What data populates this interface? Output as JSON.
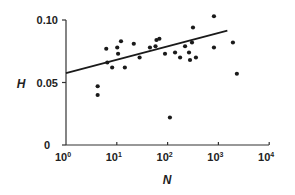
{
  "chart_data": {
    "type": "scatter",
    "title": "",
    "xlabel": "N",
    "ylabel": "H",
    "xscale": "log",
    "xlim": [
      1,
      10000
    ],
    "ylim": [
      0,
      0.1
    ],
    "x_ticks": [
      "10^0",
      "10^1",
      "10^2",
      "10^3",
      "10^4"
    ],
    "x_tick_values": [
      1,
      10,
      100,
      1000,
      10000
    ],
    "y_ticks": [
      "0",
      "0.05",
      "0.10"
    ],
    "y_tick_values": [
      0,
      0.05,
      0.1
    ],
    "grid": false,
    "legend": null,
    "series": [
      {
        "name": "data",
        "marker": "filled-circle",
        "color": "#1a1a1a",
        "points": [
          {
            "x": 4.2,
            "y": 0.047
          },
          {
            "x": 4.2,
            "y": 0.04
          },
          {
            "x": 6.2,
            "y": 0.077
          },
          {
            "x": 6.5,
            "y": 0.066
          },
          {
            "x": 8.1,
            "y": 0.062
          },
          {
            "x": 10.2,
            "y": 0.078
          },
          {
            "x": 10.6,
            "y": 0.073
          },
          {
            "x": 12.1,
            "y": 0.083
          },
          {
            "x": 14.4,
            "y": 0.062
          },
          {
            "x": 21.6,
            "y": 0.081
          },
          {
            "x": 28.1,
            "y": 0.07
          },
          {
            "x": 44.9,
            "y": 0.078
          },
          {
            "x": 57.8,
            "y": 0.079
          },
          {
            "x": 60.4,
            "y": 0.084
          },
          {
            "x": 68.9,
            "y": 0.085
          },
          {
            "x": 88.9,
            "y": 0.073
          },
          {
            "x": 111.0,
            "y": 0.022
          },
          {
            "x": 140.2,
            "y": 0.074
          },
          {
            "x": 176.2,
            "y": 0.07
          },
          {
            "x": 220.8,
            "y": 0.079
          },
          {
            "x": 264.0,
            "y": 0.074
          },
          {
            "x": 276.1,
            "y": 0.068
          },
          {
            "x": 302.0,
            "y": 0.082
          },
          {
            "x": 316.0,
            "y": 0.094
          },
          {
            "x": 361.0,
            "y": 0.07
          },
          {
            "x": 817.0,
            "y": 0.078
          },
          {
            "x": 817.0,
            "y": 0.103
          },
          {
            "x": 1930.0,
            "y": 0.082
          },
          {
            "x": 2310.0,
            "y": 0.057
          }
        ]
      },
      {
        "name": "fit",
        "type": "line",
        "color": "#1a1a1a",
        "points": [
          {
            "x": 1,
            "y": 0.0575
          },
          {
            "x": 1500,
            "y": 0.0915
          }
        ]
      }
    ]
  },
  "axes": {
    "y_axis_title": "H",
    "x_axis_title": "N",
    "y_tick_labels": [
      "0.10",
      "0.05",
      "0"
    ],
    "x_tick_bases": [
      "10",
      "10",
      "10",
      "10",
      "10"
    ],
    "x_tick_exps": [
      "0",
      "1",
      "2",
      "3",
      "4"
    ]
  }
}
